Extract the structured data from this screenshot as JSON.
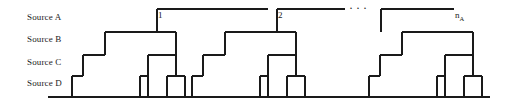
{
  "figure": {
    "type": "dendrogram-schematic",
    "background": "#ffffff",
    "line_color": "#1a1a1a",
    "ellipsis": "···"
  },
  "row_labels": [
    {
      "id": "source-a",
      "text": "Source A",
      "level_y": 9
    },
    {
      "id": "source-b",
      "text": "Source B",
      "level_y": 32
    },
    {
      "id": "source-c",
      "text": "Source C",
      "level_y": 55
    },
    {
      "id": "source-d",
      "text": "Source D",
      "level_y": 76
    }
  ],
  "cluster_labels": [
    {
      "id": "cluster-1",
      "text": "1"
    },
    {
      "id": "cluster-2",
      "text": "2"
    },
    {
      "id": "cluster-n",
      "base": "n",
      "subscript": "A"
    }
  ],
  "chart_data": {
    "type": "tree",
    "title": "",
    "xlabel": "",
    "ylabel": "",
    "levels": [
      {
        "name": "Source A",
        "y": 9
      },
      {
        "name": "Source B",
        "y": 32
      },
      {
        "name": "Source C",
        "y": 55
      },
      {
        "name": "Source D",
        "y": 76
      }
    ],
    "baseline_y": 97,
    "baseline_x": [
      48,
      490
    ],
    "clusters": [
      {
        "label": "1",
        "root_bar": {
          "y": 9,
          "x1": 157,
          "x2": 268
        },
        "segments": [
          {
            "y": 32,
            "x1": 105,
            "x2": 157
          },
          {
            "y": 55,
            "x1": 83,
            "x2": 105
          },
          {
            "y": 76,
            "x1": 72,
            "x2": 83
          },
          {
            "y": 32,
            "x1": 157,
            "x2": 176
          },
          {
            "y": 55,
            "x1": 148,
            "x2": 176
          },
          {
            "y": 76,
            "x1": 140,
            "x2": 148
          },
          {
            "y": 76,
            "x1": 167,
            "x2": 185
          }
        ],
        "leaves": [
          72,
          140,
          167,
          185
        ]
      },
      {
        "label": "2",
        "root_bar": {
          "y": 9,
          "x1": 277,
          "x2": 345
        },
        "segments": [
          {
            "y": 32,
            "x1": 225,
            "x2": 277
          },
          {
            "y": 55,
            "x1": 203,
            "x2": 225
          },
          {
            "y": 76,
            "x1": 192,
            "x2": 203
          },
          {
            "y": 32,
            "x1": 277,
            "x2": 296
          },
          {
            "y": 55,
            "x1": 268,
            "x2": 296
          },
          {
            "y": 76,
            "x1": 260,
            "x2": 268
          },
          {
            "y": 76,
            "x1": 287,
            "x2": 305
          }
        ],
        "leaves": [
          192,
          260,
          287,
          305
        ]
      },
      {
        "label": "n_A",
        "root_bar": {
          "y": 9,
          "x1": 381,
          "x2": 454
        },
        "segments": [
          {
            "y": 32,
            "x1": 402,
            "x2": 454
          },
          {
            "y": 55,
            "x1": 380,
            "x2": 402
          },
          {
            "y": 76,
            "x1": 369,
            "x2": 380
          },
          {
            "y": 32,
            "x1": 454,
            "x2": 473
          },
          {
            "y": 55,
            "x1": 445,
            "x2": 473
          },
          {
            "y": 76,
            "x1": 437,
            "x2": 445
          },
          {
            "y": 76,
            "x1": 464,
            "x2": 482
          }
        ],
        "leaves": [
          369,
          437,
          464,
          482
        ]
      }
    ]
  }
}
